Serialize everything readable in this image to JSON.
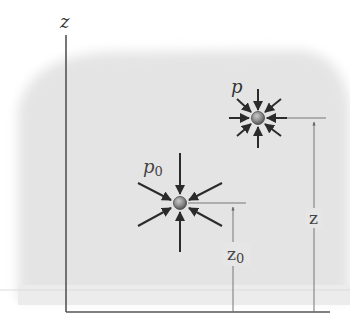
{
  "diagram": {
    "type": "pressure-at-depth",
    "axis": {
      "label": "z"
    },
    "points": [
      {
        "id": "upper",
        "pressure_label": "p",
        "height_label": "z",
        "cx": 258,
        "cy": 118
      },
      {
        "id": "lower",
        "pressure_label": "p",
        "pressure_subscript": "0",
        "height_label": "z",
        "height_subscript": "0",
        "cx": 180,
        "cy": 203
      }
    ],
    "colors": {
      "background": "#ffffff",
      "fluid_region": "#e6e6e6",
      "axis": "#555555",
      "arrow": "#2b2b2b",
      "particle": "#8a8a8a",
      "dimension_line": "#777777"
    }
  }
}
